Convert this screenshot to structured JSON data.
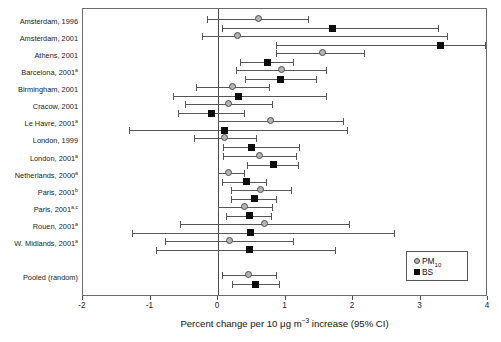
{
  "chart_data": {
    "type": "scatter",
    "title": "",
    "xlabel": "Percent change per 10 μg m−3 increase (95% CI)",
    "ylabel": "",
    "xlim": [
      -2,
      4
    ],
    "xticks": [
      -2,
      -1,
      0,
      1,
      2,
      3,
      4
    ],
    "xtick_labels": [
      "-2",
      "-1",
      "0",
      "1",
      "2",
      "3",
      "4"
    ],
    "grid": false,
    "reference_line": 0,
    "legend_position": "bottom-right",
    "legend": [
      {
        "name": "PM10",
        "label": "PM",
        "sub": "10",
        "marker": "circle",
        "color": "#b4b4b4"
      },
      {
        "name": "BS",
        "label": "BS",
        "sub": "",
        "marker": "square",
        "color": "#0d0d0d"
      }
    ],
    "categories": [
      {
        "label": "Amsterdam, 1996",
        "sup": ""
      },
      {
        "label": "Amsterdam, 2001",
        "sup": ""
      },
      {
        "label": "Athens, 2001",
        "sup": ""
      },
      {
        "label": "Barcelona, 2001",
        "sup": "a"
      },
      {
        "label": "Birmingham, 2001",
        "sup": ""
      },
      {
        "label": "Cracow, 2001",
        "sup": ""
      },
      {
        "label": "Le Havre, 2001",
        "sup": "a"
      },
      {
        "label": "London, 1999",
        "sup": ""
      },
      {
        "label": "London, 2001",
        "sup": "a"
      },
      {
        "label": "Netherlands, 2000",
        "sup": "a"
      },
      {
        "label": "Paris, 2001",
        "sup": "b"
      },
      {
        "label": "Paris, 2001",
        "sup": "a,c"
      },
      {
        "label": "Rouen, 2001",
        "sup": "a"
      },
      {
        "label": "W. Midlands, 2001",
        "sup": "a"
      },
      {
        "label": "",
        "sup": ""
      },
      {
        "label": "Pooled (random)",
        "sup": ""
      }
    ],
    "series": [
      {
        "name": "PM10",
        "marker": "circle",
        "points": [
          {
            "category": "Amsterdam, 1996",
            "estimate": 0.6,
            "low": -0.17,
            "high": 1.35
          },
          {
            "category": "Amsterdam, 2001",
            "estimate": 0.3,
            "low": -0.23,
            "high": 3.4
          },
          {
            "category": "Athens, 2001",
            "estimate": 1.56,
            "low": 0.86,
            "high": 2.18
          },
          {
            "category": "Barcelona, 2001",
            "estimate": 0.95,
            "low": 0.27,
            "high": 1.62
          },
          {
            "category": "Birmingham, 2001",
            "estimate": 0.22,
            "low": -0.32,
            "high": 0.77
          },
          {
            "category": "Cracow, 2001",
            "estimate": 0.17,
            "low": -0.49,
            "high": 0.82
          },
          {
            "category": "Le Havre, 2001",
            "estimate": 0.78,
            "low": 0.0,
            "high": 1.87
          },
          {
            "category": "London, 1999",
            "estimate": 0.1,
            "low": -0.36,
            "high": 0.58
          },
          {
            "category": "London, 2001",
            "estimate": 0.62,
            "low": 0.07,
            "high": 1.17
          },
          {
            "category": "Netherlands, 2000",
            "estimate": 0.17,
            "low": 0.0,
            "high": 0.4
          },
          {
            "category": "Paris, 2001",
            "estimate": 0.64,
            "low": 0.19,
            "high": 1.1
          },
          {
            "category": "Paris, 2001 a,c",
            "estimate": 0.4,
            "low": 0.0,
            "high": 0.82
          },
          {
            "category": "Rouen, 2001",
            "estimate": 0.7,
            "low": -0.56,
            "high": 1.95
          },
          {
            "category": "W. Midlands, 2001",
            "estimate": 0.18,
            "low": -0.78,
            "high": 1.12
          },
          {
            "category": "Pooled (random)",
            "estimate": 0.46,
            "low": 0.06,
            "high": 0.88
          }
        ]
      },
      {
        "name": "BS",
        "marker": "square",
        "points": [
          {
            "category": "Amsterdam, 1996",
            "estimate": 1.7,
            "low": 0.06,
            "high": 3.27
          },
          {
            "category": "Amsterdam, 2001",
            "estimate": 3.3,
            "low": 0.86,
            "high": 3.97
          },
          {
            "category": "Athens, 2001",
            "estimate": 0.73,
            "low": 0.33,
            "high": 1.12
          },
          {
            "category": "Barcelona, 2001",
            "estimate": 0.92,
            "low": 0.4,
            "high": 1.46
          },
          {
            "category": "Birmingham, 2001",
            "estimate": 0.3,
            "low": -0.66,
            "high": 1.62
          },
          {
            "category": "Cracow, 2001",
            "estimate": -0.1,
            "low": -0.6,
            "high": 0.4
          },
          {
            "category": "Le Havre, 2001",
            "estimate": 0.09,
            "low": -1.32,
            "high": 1.92
          },
          {
            "category": "London, 1999",
            "estimate": 0.5,
            "low": 0.08,
            "high": 1.22
          },
          {
            "category": "London, 2001",
            "estimate": 0.82,
            "low": 0.43,
            "high": 1.2
          },
          {
            "category": "Netherlands, 2000",
            "estimate": 0.42,
            "low": 0.06,
            "high": 0.72
          },
          {
            "category": "Paris, 2001",
            "estimate": 0.54,
            "low": 0.19,
            "high": 0.88
          },
          {
            "category": "Paris, 2001 a,c",
            "estimate": 0.46,
            "low": 0.12,
            "high": 0.8
          },
          {
            "category": "Rouen, 2001",
            "estimate": 0.48,
            "low": -1.28,
            "high": 2.62
          },
          {
            "category": "W. Midlands, 2001",
            "estimate": 0.47,
            "low": -0.92,
            "high": 1.75
          },
          {
            "category": "Pooled (random)",
            "estimate": 0.55,
            "low": 0.21,
            "high": 0.92
          }
        ]
      }
    ]
  }
}
